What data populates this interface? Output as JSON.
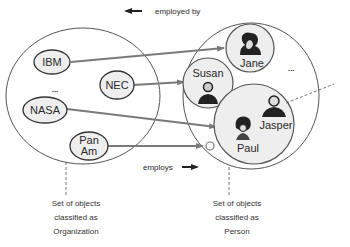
{
  "diagram": {
    "top_label": {
      "text": "employed by",
      "arrow": "left-arrow"
    },
    "bottom_label": {
      "text": "employs",
      "arrow": "right-arrow"
    },
    "sets": [
      {
        "id": "organization",
        "caption_lines": [
          "Set of objects",
          "classified as",
          "Organization"
        ],
        "members": [
          {
            "label": "IBM"
          },
          {
            "label": "NEC"
          },
          {
            "label": "NASA"
          },
          {
            "label_lines": [
              "Pan",
              "Am"
            ]
          }
        ],
        "ellipsis": "..."
      },
      {
        "id": "person",
        "caption_lines": [
          "Set of objects",
          "classified as",
          "Person"
        ],
        "members": [
          {
            "label": "Jane",
            "icon": "person-icon"
          },
          {
            "label": "Susan",
            "icon": "person-icon"
          },
          {
            "label": "Jasper",
            "icon": "person-icon"
          },
          {
            "label": "Paul",
            "icon": "person-icon"
          },
          {
            "label": "",
            "icon": "empty-object-circle"
          }
        ],
        "ellipsis": "..."
      }
    ],
    "relationships": [
      {
        "from": "IBM",
        "to": "Jane"
      },
      {
        "from": "NEC",
        "to": "Susan"
      },
      {
        "from": "NASA",
        "to": "Jasper/Paul"
      },
      {
        "from": "Pan Am",
        "to": "unnamed person"
      }
    ],
    "colors": {
      "line": "#444444",
      "arrow": "#7a7a7a",
      "node_fill": "#eeeeee",
      "background": "#ffffff"
    }
  }
}
